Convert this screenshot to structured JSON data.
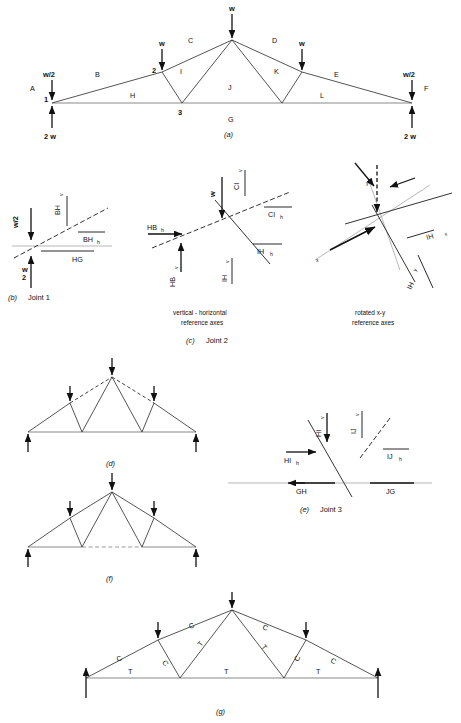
{
  "figure": {
    "panels": [
      {
        "id": "a",
        "caption": "(a)"
      },
      {
        "id": "b",
        "caption": "(b)",
        "subject": "Joint  1"
      },
      {
        "id": "c",
        "caption": "(c)",
        "subject": "Joint  2",
        "note_left": [
          "vertical - horizontal",
          "reference  axes"
        ],
        "note_right": [
          "rotated  x-y",
          "reference  axes"
        ]
      },
      {
        "id": "d",
        "caption": "(d)"
      },
      {
        "id": "e",
        "caption": "(e)",
        "subject": "Joint  3"
      },
      {
        "id": "f",
        "caption": "(f)"
      },
      {
        "id": "g",
        "caption": "(g)"
      }
    ]
  },
  "panel_a": {
    "space_labels": [
      "A",
      "B",
      "C",
      "D",
      "E",
      "F"
    ],
    "interior_labels": [
      "H",
      "I",
      "J",
      "K",
      "L",
      "G"
    ],
    "joint_numbers": [
      "1",
      "2",
      "3"
    ],
    "loads": {
      "apex": "w",
      "left_panel_point": "w",
      "right_panel_point": "w",
      "left_end": "w/2",
      "right_end": "w/2"
    },
    "reactions": {
      "left": "2 w",
      "right": "2 w"
    }
  },
  "panel_b": {
    "forces": [
      "BH",
      "BH",
      "HG"
    ],
    "label_bh_v_main": "BH",
    "label_bh_v_sub": "v",
    "label_bh_h_main": "BH",
    "label_bh_h_sub": "h",
    "label_hg": "HG",
    "load": "w/2",
    "reaction_num": "2",
    "reaction_den": "w",
    "reaction": "2 w"
  },
  "panel_c_left": {
    "load": "w",
    "labels": [
      {
        "main": "HB",
        "sub": "h"
      },
      {
        "main": "HB",
        "sub": "v"
      },
      {
        "main": "CI",
        "sub": "v"
      },
      {
        "main": "CI",
        "sub": "h"
      },
      {
        "main": "IH",
        "sub": "h"
      },
      {
        "main": "IH",
        "sub": "v"
      }
    ]
  },
  "panel_c_right": {
    "axis_x": "x",
    "axis_y": "y",
    "labels": [
      {
        "main": "IH",
        "sub": "x"
      },
      {
        "main": "IH",
        "sub": "y"
      }
    ]
  },
  "panel_e": {
    "labels": [
      {
        "main": "HI",
        "sub": "v"
      },
      {
        "main": "IJ",
        "sub": "v"
      },
      {
        "main": "HI",
        "sub": "h"
      },
      {
        "main": "IJ",
        "sub": "h"
      },
      {
        "main": "GH",
        "sub": ""
      },
      {
        "main": "JG",
        "sub": ""
      }
    ]
  },
  "panel_g": {
    "compression": "C",
    "tension": "T",
    "top_chord": [
      "C",
      "C",
      "C",
      "C"
    ],
    "web": [
      "C",
      "T",
      "T",
      "C"
    ],
    "bottom_chord": [
      "T",
      "T",
      "T"
    ]
  }
}
